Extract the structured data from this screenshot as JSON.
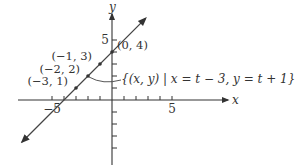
{
  "chart_data": {
    "type": "line",
    "title": "",
    "xlabel": "x",
    "ylabel": "y",
    "xlim": [
      -8,
      8
    ],
    "ylim": [
      -6,
      7.5
    ],
    "x_ticks": [
      -5,
      -4,
      -3,
      -2,
      -1,
      1,
      2,
      3,
      4,
      5
    ],
    "y_ticks": [
      -4,
      -3,
      -2,
      -1,
      1,
      2,
      3,
      4,
      5
    ],
    "x_tick_labels": [
      {
        "value": -5,
        "label": "−5"
      },
      {
        "value": 5,
        "label": "5"
      }
    ],
    "y_tick_labels": [
      {
        "value": 5,
        "label": "5"
      }
    ],
    "grid": false,
    "series": [
      {
        "name": "{(x, y) | x = t − 3, y = t + 1}",
        "equation": "y = x + 4",
        "x_range": [
          -7.5,
          2.8
        ],
        "arrows": "both",
        "color": "#444444"
      }
    ],
    "points": [
      {
        "x": -3,
        "y": 1,
        "label": "(−3, 1)"
      },
      {
        "x": -2,
        "y": 2,
        "label": "(−2, 2)"
      },
      {
        "x": -1,
        "y": 3,
        "label": "(−1, 3)"
      },
      {
        "x": 0,
        "y": 4,
        "label": "(0, 4)"
      }
    ],
    "annotation": {
      "text": "{(x, y) | x = t − 3, y = t + 1}",
      "points_to": {
        "x": -2,
        "y": 2
      }
    }
  }
}
